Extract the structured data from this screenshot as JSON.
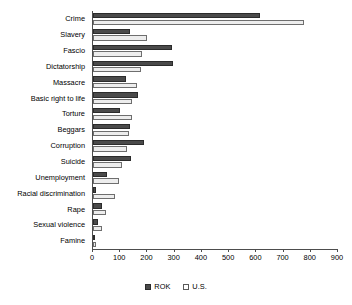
{
  "chart_data": {
    "type": "bar",
    "orientation": "horizontal",
    "title": "",
    "subtitle": "",
    "xlabel": "",
    "ylabel": "",
    "xlim": [
      0,
      900
    ],
    "xticks": [
      0,
      100,
      200,
      300,
      400,
      500,
      600,
      700,
      800,
      900
    ],
    "xtick_labels": [
      "0",
      "100",
      "200",
      "300",
      "400",
      "500",
      "600",
      "700",
      "800",
      "900"
    ],
    "grid": false,
    "legend_position": "bottom-center",
    "categories": [
      "Crime",
      "Slavery",
      "Fascio",
      "Dictatorship",
      "Massacre",
      "Basic right to life",
      "Torture",
      "Beggars",
      "Corruption",
      "Suicide",
      "Unemployment",
      "Racial discrimination",
      "Rape",
      "Sexual violence",
      "Famine"
    ],
    "series": [
      {
        "name": "ROK",
        "color": "#4a4a4a",
        "values": [
          615,
          135,
          290,
          295,
          120,
          165,
          100,
          135,
          188,
          140,
          52,
          10,
          32,
          20,
          5
        ]
      },
      {
        "name": "U.S.",
        "color": "#ededed",
        "values": [
          775,
          200,
          180,
          175,
          160,
          145,
          143,
          133,
          125,
          108,
          95,
          80,
          48,
          33,
          10
        ]
      }
    ]
  },
  "legend": {
    "items": [
      {
        "label": "ROK",
        "swatch": "filled-dark-square"
      },
      {
        "label": "U.S.",
        "swatch": "outlined-white-square"
      }
    ]
  }
}
